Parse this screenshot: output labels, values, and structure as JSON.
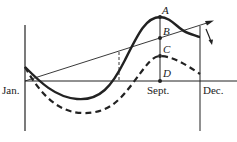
{
  "diagram": {
    "axis_labels": {
      "start": "Jan.",
      "middle": "Sept.",
      "end": "Dec."
    },
    "points": {
      "a": "A",
      "b": "B",
      "c": "C",
      "d": "D"
    },
    "colors": {
      "ink": "#222222",
      "background": "#ffffff"
    },
    "elements": [
      "solid curve",
      "dashed curve",
      "straight trend line with arrow",
      "vertical line at Sept. through A, B, C, D",
      "vertical line at Dec.",
      "dashed vertical guide",
      "downward arrow near Dec."
    ]
  }
}
